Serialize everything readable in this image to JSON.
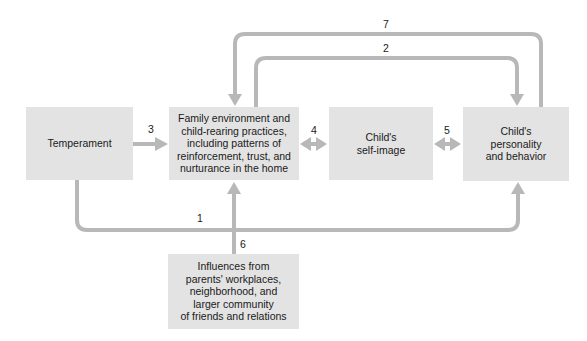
{
  "diagram": {
    "nodes": [
      {
        "id": "temperament",
        "label": "Temperament"
      },
      {
        "id": "family",
        "label": "Family environment and\nchild-rearing practices,\nincluding patterns of\nreinforcement, trust, and\nnurturance in the home"
      },
      {
        "id": "self_image",
        "label": "Child's\nself-image"
      },
      {
        "id": "personality",
        "label": "Child's\npersonality\nand behavior"
      },
      {
        "id": "influences",
        "label": "Influences from\nparents' workplaces,\nneighborhood, and\nlarger community\nof friends and relations"
      }
    ],
    "edges": [
      {
        "number": "1",
        "from": "temperament",
        "to": "personality",
        "direction": "one-way"
      },
      {
        "number": "2",
        "from": "family",
        "to": "personality",
        "direction": "one-way"
      },
      {
        "number": "3",
        "from": "temperament",
        "to": "family",
        "direction": "one-way"
      },
      {
        "number": "4",
        "from": "family",
        "to": "self_image",
        "direction": "two-way"
      },
      {
        "number": "5",
        "from": "self_image",
        "to": "personality",
        "direction": "two-way"
      },
      {
        "number": "6",
        "from": "influences",
        "to": "family",
        "direction": "one-way"
      },
      {
        "number": "7",
        "from": "personality",
        "to": "family",
        "direction": "one-way"
      }
    ],
    "colors": {
      "box": "#e3e3e3",
      "arrow": "#b8b8b8",
      "text": "#1a1a1a"
    }
  }
}
